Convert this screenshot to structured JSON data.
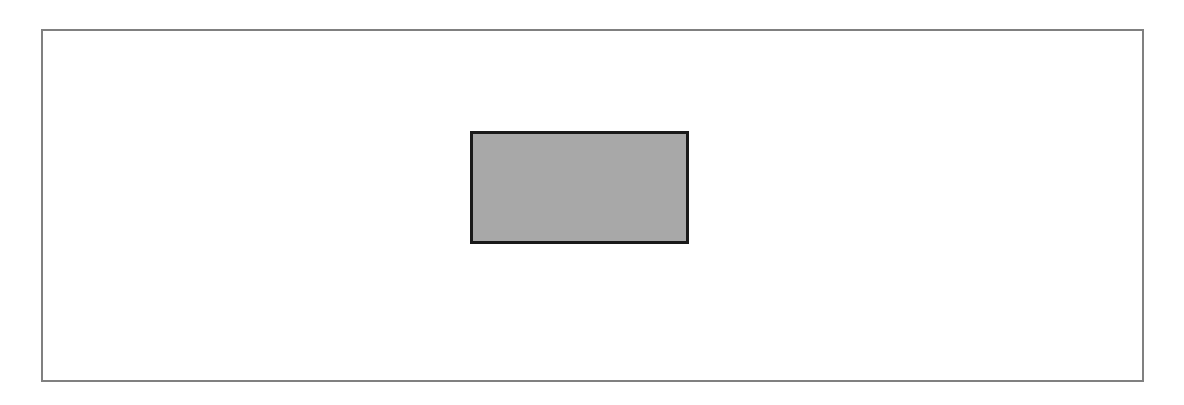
{
  "diagram": {
    "outer_frame": {
      "border_color": "#808080",
      "fill_color": "#ffffff"
    },
    "inner_rectangle": {
      "border_color": "#1a1a1a",
      "fill_color": "#a8a8a8"
    }
  }
}
